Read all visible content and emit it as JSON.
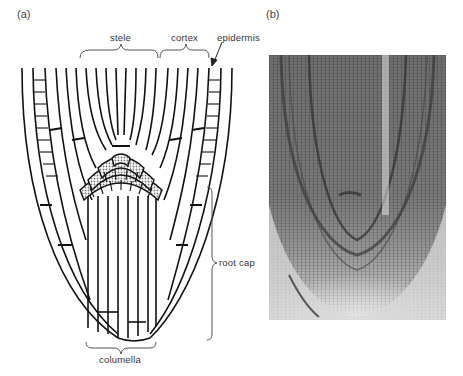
{
  "figure": {
    "panels": [
      {
        "id": "a",
        "label": "(a)",
        "type": "schematic drawing of root tip"
      },
      {
        "id": "b",
        "label": "(b)",
        "type": "micrograph of root tip section"
      }
    ],
    "labels": {
      "stele": "stele",
      "cortex": "cortex",
      "epidermis": "epidermis",
      "root_cap": "root cap",
      "columella": "columella"
    },
    "colors": {
      "ink": "#111111",
      "label_text": "#333333",
      "stipple": "#9a9a9a",
      "photo_dark": "#555555",
      "photo_light": "#e0e0e0"
    }
  }
}
